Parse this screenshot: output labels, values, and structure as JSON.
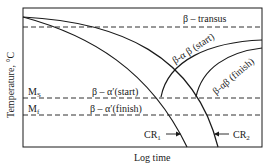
{
  "diagram": {
    "type": "CCT diagram (continuous cooling transformation)",
    "xlabel": "Log time",
    "ylabel": "Temperature, °C",
    "lines": {
      "beta_transus": "β – transus",
      "ms_label": "MS",
      "ms_sub": "S",
      "ms_main": "M",
      "mf_main": "M",
      "mf_sub": "f",
      "beta_alpha_prime_start": "β – α′(start)",
      "beta_alpha_prime_finish": "β – α′(finish)"
    },
    "curves": {
      "beta_alpha_beta_start": "β-α β (start)",
      "beta_alpha_beta_finish": "β-αβ (finish)",
      "cr1_main": "CR",
      "cr1_sub": "1",
      "cr2_main": "CR",
      "cr2_sub": "2"
    },
    "colors": {
      "line": "#1a1a1a",
      "background": "#ffffff"
    }
  }
}
